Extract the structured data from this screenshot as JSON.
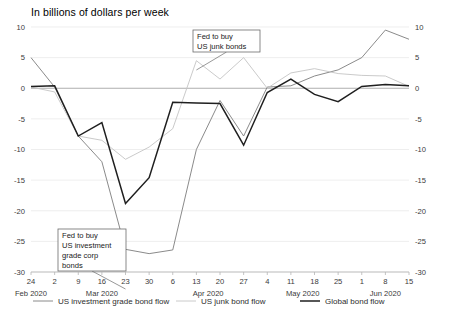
{
  "chart_data": {
    "type": "line",
    "title": "In billions of dollars per week",
    "xlabel": "",
    "ylabel": "",
    "ylim": [
      -30,
      10
    ],
    "ytick_values": [
      10,
      5,
      0,
      -5,
      -10,
      -15,
      -20,
      -25,
      -30
    ],
    "ytick_labels": [
      "10",
      "5",
      "0",
      "-5",
      "-10",
      "-15",
      "-20",
      "-25",
      "-30"
    ],
    "y_axis_both_sides": true,
    "grid": true,
    "legend_position": "bottom",
    "categories": [
      "24",
      "2",
      "9",
      "16",
      "23",
      "30",
      "6",
      "13",
      "20",
      "27",
      "4",
      "11",
      "18",
      "25",
      "1",
      "8",
      "15"
    ],
    "month_groups": [
      {
        "label": "Feb 2020",
        "start_index": 0,
        "end_index": 0
      },
      {
        "label": "Mar 2020",
        "start_index": 1,
        "end_index": 5
      },
      {
        "label": "Apr 2020",
        "start_index": 6,
        "end_index": 9
      },
      {
        "label": "May 2020",
        "start_index": 10,
        "end_index": 13
      },
      {
        "label": "Jun 2020",
        "start_index": 14,
        "end_index": 16
      }
    ],
    "series": [
      {
        "name": "US investment grade bond flow",
        "color": "#7d7d7d",
        "width": 0.9,
        "values": [
          5.0,
          0.2,
          -7.8,
          -12.0,
          -26.3,
          -27.0,
          -26.4,
          -10.0,
          -2.0,
          -7.8,
          0.2,
          0.4,
          2.0,
          3.0,
          5.0,
          9.5,
          8.0
        ]
      },
      {
        "name": "US junk bond flow",
        "color": "#c4c4c4",
        "width": 0.9,
        "values": [
          0.2,
          -0.6,
          -7.8,
          -8.5,
          -11.6,
          -9.6,
          -6.6,
          4.5,
          1.5,
          5.0,
          0.0,
          2.5,
          3.2,
          2.4,
          2.1,
          2.0,
          0.3
        ]
      },
      {
        "name": "Global bond flow",
        "color": "#1f1f1f",
        "width": 1.5,
        "values": [
          0.3,
          0.4,
          -7.8,
          -5.6,
          -18.8,
          -14.6,
          -2.3,
          -2.4,
          -2.5,
          -9.3,
          -0.7,
          1.5,
          -1.0,
          -2.2,
          0.3,
          0.6,
          0.4
        ]
      }
    ],
    "annotations": [
      {
        "id": "junk-bonds-annotation",
        "lines": [
          "Fed to buy",
          "US junk bonds"
        ],
        "box": {
          "x": 193,
          "y": 30,
          "width": 67,
          "height": 22
        },
        "leader_to_index": 7
      },
      {
        "id": "investment-grade-annotation",
        "lines": [
          "Fed to buy",
          "US investment",
          "grade corp",
          "bonds"
        ],
        "box": {
          "x": 58,
          "y": 229,
          "width": 68,
          "height": 42
        },
        "leader_to_index": 4
      }
    ]
  },
  "legend": {
    "items": [
      {
        "label": "US investment grade bond flow",
        "color": "#7d7d7d",
        "width": 0.9
      },
      {
        "label": "US junk bond flow",
        "color": "#c4c4c4",
        "width": 0.9
      },
      {
        "label": "Global bond flow",
        "color": "#1f1f1f",
        "width": 1.5
      }
    ]
  }
}
